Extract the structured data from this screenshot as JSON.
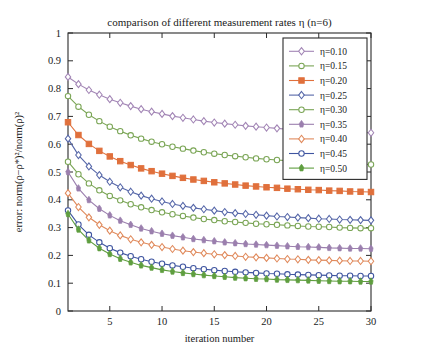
{
  "chart_data": {
    "type": "line",
    "title": "comparison of different measurement rates η (n=6)",
    "xlabel": "iteration number",
    "ylabel": "error: norm(ρ−ρ*)²/norm(ρ)²",
    "xlim": [
      1,
      30
    ],
    "ylim": [
      0,
      1
    ],
    "xticks": [
      5,
      10,
      15,
      20,
      25,
      30
    ],
    "yticks": [
      0,
      0.1,
      0.2,
      0.3,
      0.4,
      0.5,
      0.6,
      0.7,
      0.8,
      0.9,
      1
    ],
    "ytick_labels": [
      "0",
      "0.1",
      "0.2",
      "0.3",
      "0.4",
      "0.5",
      "0.6",
      "0.7",
      "0.8",
      "0.9",
      "1"
    ],
    "xtick_labels": [
      "5",
      "10",
      "15",
      "20",
      "25",
      "30"
    ],
    "grid": false,
    "legend_position": "top-right",
    "x": [
      1,
      2,
      3,
      4,
      5,
      6,
      7,
      8,
      9,
      10,
      11,
      12,
      13,
      14,
      15,
      16,
      17,
      18,
      19,
      20,
      21,
      22,
      23,
      24,
      25,
      26,
      27,
      28,
      29,
      30
    ],
    "series": [
      {
        "name": "η=0.10",
        "legend_label": "η=0.10",
        "color": "#a285b5",
        "marker": "diamond",
        "filled": false,
        "values": [
          0.842,
          0.816,
          0.795,
          0.778,
          0.762,
          0.749,
          0.737,
          0.726,
          0.717,
          0.709,
          0.701,
          0.695,
          0.689,
          0.683,
          0.678,
          0.674,
          0.67,
          0.666,
          0.663,
          0.66,
          0.657,
          0.654,
          0.652,
          0.65,
          0.648,
          0.646,
          0.645,
          0.643,
          0.642,
          0.641
        ]
      },
      {
        "name": "η=0.15",
        "legend_label": "η=0.15",
        "color": "#7aa555",
        "marker": "circle",
        "filled": false,
        "values": [
          0.773,
          0.735,
          0.706,
          0.683,
          0.663,
          0.647,
          0.632,
          0.62,
          0.609,
          0.6,
          0.591,
          0.584,
          0.577,
          0.571,
          0.566,
          0.561,
          0.557,
          0.553,
          0.549,
          0.546,
          0.543,
          0.541,
          0.538,
          0.536,
          0.534,
          0.532,
          0.531,
          0.529,
          0.528,
          0.527
        ]
      },
      {
        "name": "η=0.20",
        "legend_label": "η=0.20",
        "color": "#e0703c",
        "marker": "square",
        "filled": true,
        "values": [
          0.679,
          0.633,
          0.601,
          0.576,
          0.556,
          0.539,
          0.525,
          0.513,
          0.503,
          0.494,
          0.486,
          0.479,
          0.473,
          0.468,
          0.463,
          0.459,
          0.455,
          0.451,
          0.448,
          0.445,
          0.443,
          0.44,
          0.438,
          0.436,
          0.435,
          0.433,
          0.432,
          0.43,
          0.429,
          0.428
        ]
      },
      {
        "name": "η=0.25",
        "legend_label": "η=0.25",
        "color": "#5566a8",
        "marker": "diamond",
        "filled": false,
        "values": [
          0.62,
          0.561,
          0.52,
          0.489,
          0.465,
          0.445,
          0.429,
          0.415,
          0.404,
          0.394,
          0.385,
          0.378,
          0.371,
          0.366,
          0.361,
          0.356,
          0.352,
          0.349,
          0.346,
          0.343,
          0.34,
          0.338,
          0.336,
          0.334,
          0.332,
          0.331,
          0.329,
          0.328,
          0.327,
          0.326
        ]
      },
      {
        "name": "η=0.30",
        "legend_label": "η=0.30",
        "color": "#7aa555",
        "marker": "circle",
        "filled": false,
        "values": [
          0.537,
          0.492,
          0.459,
          0.434,
          0.414,
          0.398,
          0.384,
          0.373,
          0.363,
          0.355,
          0.348,
          0.342,
          0.336,
          0.331,
          0.327,
          0.323,
          0.32,
          0.317,
          0.314,
          0.312,
          0.31,
          0.308,
          0.306,
          0.304,
          0.303,
          0.302,
          0.3,
          0.299,
          0.298,
          0.298
        ]
      },
      {
        "name": "η=0.35",
        "legend_label": "η=0.35",
        "color": "#9b7fae",
        "marker": "star",
        "filled": true,
        "values": [
          0.5,
          0.441,
          0.399,
          0.368,
          0.344,
          0.325,
          0.31,
          0.297,
          0.287,
          0.278,
          0.271,
          0.265,
          0.259,
          0.255,
          0.251,
          0.247,
          0.244,
          0.241,
          0.239,
          0.237,
          0.235,
          0.233,
          0.231,
          0.23,
          0.229,
          0.227,
          0.226,
          0.225,
          0.225,
          0.224
        ]
      },
      {
        "name": "η=0.40",
        "legend_label": "η=0.40",
        "color": "#e08a5c",
        "marker": "diamond",
        "filled": false,
        "values": [
          0.424,
          0.374,
          0.337,
          0.31,
          0.289,
          0.272,
          0.258,
          0.247,
          0.238,
          0.23,
          0.223,
          0.217,
          0.212,
          0.208,
          0.204,
          0.201,
          0.198,
          0.195,
          0.193,
          0.191,
          0.189,
          0.187,
          0.186,
          0.184,
          0.183,
          0.182,
          0.181,
          0.18,
          0.18,
          0.179
        ]
      },
      {
        "name": "η=0.45",
        "legend_label": "η=0.45",
        "color": "#3f55a0",
        "marker": "circle",
        "filled": false,
        "values": [
          0.362,
          0.311,
          0.274,
          0.247,
          0.226,
          0.21,
          0.197,
          0.186,
          0.177,
          0.17,
          0.164,
          0.159,
          0.154,
          0.15,
          0.147,
          0.144,
          0.141,
          0.139,
          0.137,
          0.135,
          0.134,
          0.132,
          0.131,
          0.13,
          0.129,
          0.128,
          0.127,
          0.127,
          0.126,
          0.126
        ]
      },
      {
        "name": "η=0.50",
        "legend_label": "η=0.50",
        "color": "#5f9e3f",
        "marker": "star",
        "filled": true,
        "values": [
          0.349,
          0.293,
          0.254,
          0.226,
          0.205,
          0.188,
          0.175,
          0.164,
          0.156,
          0.148,
          0.142,
          0.137,
          0.133,
          0.129,
          0.126,
          0.123,
          0.12,
          0.118,
          0.116,
          0.115,
          0.113,
          0.112,
          0.111,
          0.11,
          0.109,
          0.108,
          0.107,
          0.107,
          0.106,
          0.106
        ]
      }
    ]
  }
}
